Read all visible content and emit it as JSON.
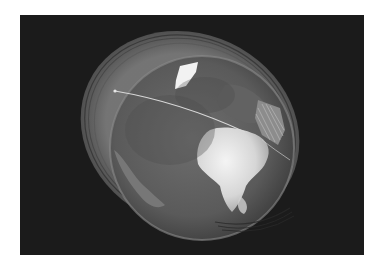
{
  "scene": {
    "subject": "earth-globe-render",
    "mode": "grayscale",
    "background_color": "#1b1b1b",
    "frame_color": "#ffffff",
    "globe": {
      "center": [
        200,
        145
      ],
      "ghost_halo": true,
      "features": [
        "greenland",
        "africa",
        "europe",
        "arabia",
        "south-america"
      ]
    },
    "trajectory": {
      "start": [
        115,
        91
      ],
      "end": [
        245,
        132
      ],
      "color": "#d8d8d8"
    }
  }
}
